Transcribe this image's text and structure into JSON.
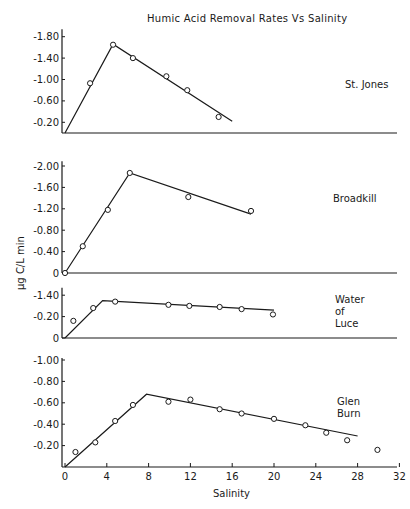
{
  "chart_data": {
    "type": "line",
    "title": "Humic Acid Removal Rates Vs Salinity",
    "xlabel": "Salinity",
    "ylabel": "µg C/L min",
    "x_ticks": [
      0,
      4,
      8,
      12,
      16,
      20,
      24,
      28,
      32
    ],
    "xlim": [
      0,
      32
    ],
    "panels": [
      {
        "name": "St. Jones",
        "label_lines": [
          "St. Jones"
        ],
        "y_tick_labels": [
          "-1.80",
          "-1.40",
          "-1.00",
          "-0.60",
          "-0.20"
        ],
        "y_tick_values": [
          -1.8,
          -1.4,
          -1.0,
          -0.6,
          -0.2
        ],
        "ylim": [
          0,
          -1.9
        ],
        "points": [
          {
            "x": 2.4,
            "y": -0.93
          },
          {
            "x": 4.6,
            "y": -1.65
          },
          {
            "x": 6.5,
            "y": -1.4
          },
          {
            "x": 9.7,
            "y": -1.06
          },
          {
            "x": 11.7,
            "y": -0.8
          },
          {
            "x": 14.7,
            "y": -0.3
          }
        ],
        "fit_line": [
          {
            "x": 0,
            "y": 0
          },
          {
            "x": 4.6,
            "y": -1.66
          },
          {
            "x": 16.0,
            "y": -0.22
          }
        ]
      },
      {
        "name": "Broadkill",
        "label_lines": [
          "Broadkill"
        ],
        "y_tick_labels": [
          "-2.00",
          "-1.60",
          "-1.20",
          "-0.80",
          "-0.40",
          "0"
        ],
        "y_tick_values": [
          -2.0,
          -1.6,
          -1.2,
          -0.8,
          -0.4,
          0
        ],
        "ylim": [
          0,
          -2.05
        ],
        "points": [
          {
            "x": 0.0,
            "y": 0.0
          },
          {
            "x": 1.7,
            "y": -0.5
          },
          {
            "x": 4.1,
            "y": -1.18
          },
          {
            "x": 6.2,
            "y": -1.87
          },
          {
            "x": 11.8,
            "y": -1.42
          },
          {
            "x": 17.8,
            "y": -1.16
          }
        ],
        "fit_line": [
          {
            "x": 0,
            "y": 0
          },
          {
            "x": 6.2,
            "y": -1.87
          },
          {
            "x": 17.8,
            "y": -1.1
          }
        ]
      },
      {
        "name": "Water of Luce",
        "label_lines": [
          "Water",
          "of",
          "Luce"
        ],
        "y_tick_labels": [
          "-1.40",
          "-0.20",
          "0"
        ],
        "y_tick_values": [
          -0.4,
          -0.2,
          0
        ],
        "ylim": [
          0,
          -0.45
        ],
        "points": [
          {
            "x": 0.8,
            "y": -0.16
          },
          {
            "x": 2.7,
            "y": -0.28
          },
          {
            "x": 4.8,
            "y": -0.34
          },
          {
            "x": 9.9,
            "y": -0.31
          },
          {
            "x": 11.9,
            "y": -0.3
          },
          {
            "x": 14.8,
            "y": -0.29
          },
          {
            "x": 16.9,
            "y": -0.27
          },
          {
            "x": 19.9,
            "y": -0.22
          }
        ],
        "fit_line": [
          {
            "x": 0,
            "y": 0
          },
          {
            "x": 3.6,
            "y": -0.35
          },
          {
            "x": 20.0,
            "y": -0.26
          }
        ]
      },
      {
        "name": "Glen Burn",
        "label_lines": [
          "Glen",
          "Burn"
        ],
        "y_tick_labels": [
          "-1.00",
          "-0.80",
          "-0.60",
          "-0.40",
          "-0.20"
        ],
        "y_tick_values": [
          -1.0,
          -0.8,
          -0.6,
          -0.4,
          -0.2
        ],
        "ylim": [
          0,
          -1.0
        ],
        "points": [
          {
            "x": 1.0,
            "y": -0.14
          },
          {
            "x": 2.9,
            "y": -0.23
          },
          {
            "x": 4.8,
            "y": -0.43
          },
          {
            "x": 6.5,
            "y": -0.58
          },
          {
            "x": 9.9,
            "y": -0.61
          },
          {
            "x": 12.0,
            "y": -0.63
          },
          {
            "x": 14.8,
            "y": -0.54
          },
          {
            "x": 16.9,
            "y": -0.5
          },
          {
            "x": 20.0,
            "y": -0.45
          },
          {
            "x": 23.0,
            "y": -0.39
          },
          {
            "x": 25.0,
            "y": -0.32
          },
          {
            "x": 27.0,
            "y": -0.25
          },
          {
            "x": 29.9,
            "y": -0.16
          }
        ],
        "fit_line": [
          {
            "x": 0,
            "y": 0
          },
          {
            "x": 7.8,
            "y": -0.68
          },
          {
            "x": 28.0,
            "y": -0.29
          }
        ]
      }
    ],
    "grid": false,
    "legend": "none (panel labels at right)"
  }
}
